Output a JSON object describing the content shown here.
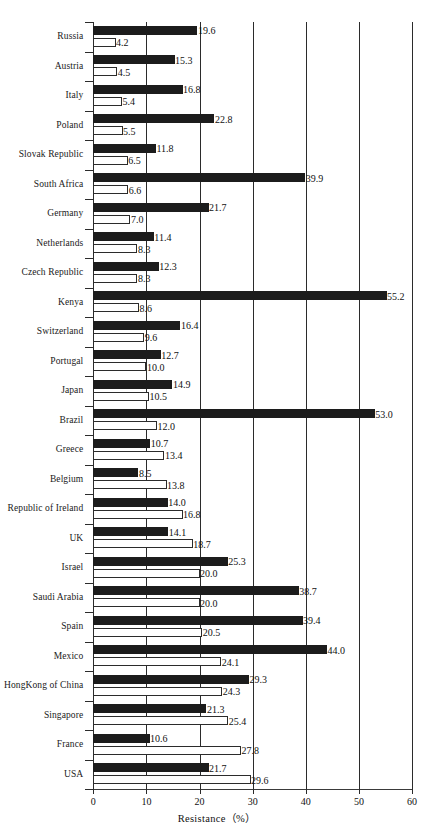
{
  "chart_data": {
    "type": "bar",
    "orientation": "horizontal",
    "title": "",
    "xlabel": "Resistance（%）",
    "ylabel": "",
    "xlim": [
      0,
      60
    ],
    "xticks": [
      0,
      10,
      20,
      30,
      40,
      50,
      60
    ],
    "xtick_labels": [
      "0",
      "10",
      "20",
      "30",
      "40",
      "50",
      "60"
    ],
    "grid": true,
    "grid_axis": "x",
    "legend": "none",
    "categories": [
      "Russia",
      "Austria",
      "Italy",
      "Poland",
      "Slovak Republic",
      "South Africa",
      "Germany",
      "Netherlands",
      "Czech Republic",
      "Kenya",
      "Switzerland",
      "Portugal",
      "Japan",
      "Brazil",
      "Greece",
      "Belgium",
      "Republic of Ireland",
      "UK",
      "Israel",
      "Saudi Arabia",
      "Spain",
      "Mexico",
      "HongKong of China",
      "Singapore",
      "France",
      "USA"
    ],
    "series": [
      {
        "name": "series-dark",
        "style": "filled-black",
        "color": "#1c1c1c",
        "values": [
          19.6,
          15.3,
          16.8,
          22.8,
          11.8,
          39.9,
          21.7,
          11.4,
          12.3,
          55.2,
          16.4,
          12.7,
          14.9,
          53.0,
          10.7,
          8.5,
          14.0,
          14.1,
          25.3,
          38.7,
          39.4,
          44.0,
          29.3,
          21.3,
          10.6,
          21.7
        ],
        "labels": [
          "19.6",
          "15.3",
          "16.8",
          "22.8",
          "11.8",
          "39.9",
          "21.7",
          "11.4",
          "12.3",
          "55.2",
          "16.4",
          "12.7",
          "14.9",
          "53.0",
          "10.7",
          "8.5",
          "14.0",
          "14.1",
          "25.3",
          "38.7",
          "39.4",
          "44.0",
          "29.3",
          "21.3",
          "10.6",
          "21.7"
        ]
      },
      {
        "name": "series-light",
        "style": "open-white",
        "color": "#ffffff",
        "values": [
          4.2,
          4.5,
          5.4,
          5.5,
          6.5,
          6.6,
          7.0,
          8.3,
          8.3,
          8.6,
          9.6,
          10.0,
          10.5,
          12.0,
          13.4,
          13.8,
          16.8,
          18.7,
          20.0,
          20.0,
          20.5,
          24.1,
          24.3,
          25.4,
          27.8,
          29.6
        ],
        "labels": [
          "4.2",
          "4.5",
          "5.4",
          "5.5",
          "6.5",
          "6.6",
          "7.0",
          "8.3",
          "8.3",
          "8.6",
          "9.6",
          "10.0",
          "10.5",
          "12.0",
          "13.4",
          "13.8",
          "16.8",
          "18.7",
          "20.0",
          "20.0",
          "20.5",
          "24.1",
          "24.3",
          "25.4",
          "27.8",
          "29.6"
        ]
      }
    ]
  }
}
